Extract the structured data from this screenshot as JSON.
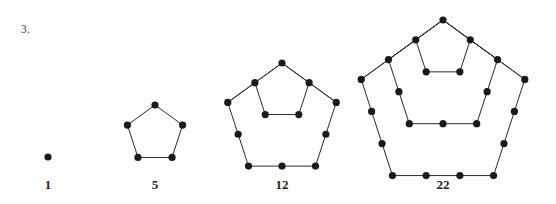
{
  "problem": {
    "number_label": "3."
  },
  "figures": [
    {
      "name": "figure-1",
      "caption": "1",
      "caption_x": 48,
      "caption_y": 178,
      "rings": 0,
      "center_x": 48,
      "apex_y": 157,
      "radius": 0,
      "dot_only": true
    },
    {
      "name": "figure-2",
      "caption": "5",
      "caption_x": 155,
      "caption_y": 178,
      "rings": 1,
      "center_x": 155,
      "apex_y": 105,
      "radius": 29,
      "dot_only": false
    },
    {
      "name": "figure-3",
      "caption": "12",
      "caption_x": 282,
      "caption_y": 178,
      "rings": 2,
      "center_x": 282,
      "apex_y": 63,
      "radius": 57,
      "dot_only": false
    },
    {
      "name": "figure-4",
      "caption": "22",
      "caption_x": 443,
      "caption_y": 178,
      "rings": 3,
      "center_x": 443,
      "apex_y": 20,
      "radius": 86,
      "dot_only": false
    }
  ],
  "style": {
    "dot_color": "#1a1a1a",
    "edge_color": "#2b2b2b",
    "dot_radius": 3.6,
    "edge_width": 1.0,
    "paper_color": "#fdfdfb",
    "text_color": "#242427"
  },
  "chart_data": {
    "type": "diagram",
    "sequence_name": "pentagonal numbers",
    "formula": "P(n) = n(3n-1)/2",
    "terms": [
      {
        "n": 1,
        "value": 1,
        "label": "1",
        "rings": 0,
        "dots_total": 1
      },
      {
        "n": 2,
        "value": 5,
        "label": "5",
        "rings": 1,
        "dots_total": 5
      },
      {
        "n": 3,
        "value": 12,
        "label": "12",
        "rings": 2,
        "dots_total": 12
      },
      {
        "n": 4,
        "value": 22,
        "label": "22",
        "rings": 3,
        "dots_total": 22
      }
    ],
    "categories": [
      "1",
      "5",
      "12",
      "22"
    ],
    "values": [
      1,
      5,
      12,
      22
    ],
    "xlabel": "",
    "ylabel": "",
    "grid": false,
    "legend": false
  }
}
